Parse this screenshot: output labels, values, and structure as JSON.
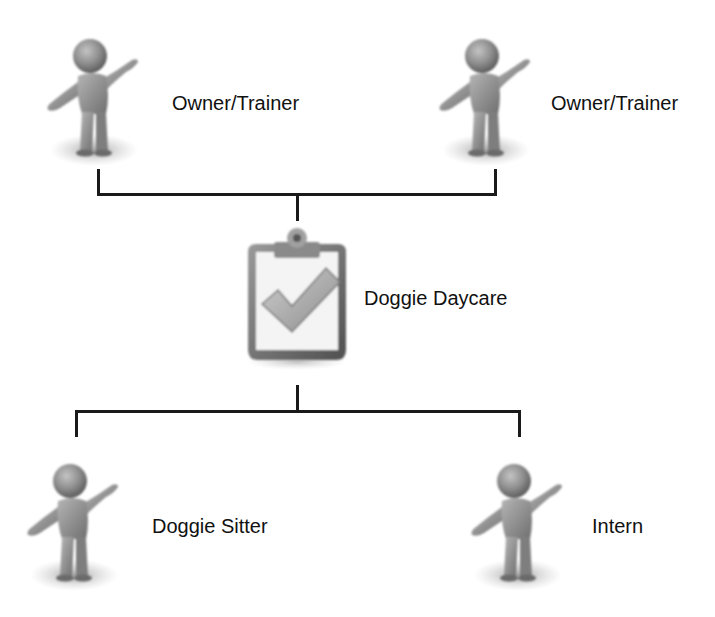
{
  "diagram": {
    "type": "org-chart",
    "top_nodes": [
      {
        "label": "Owner/Trainer",
        "icon": "person-figure-icon"
      },
      {
        "label": "Owner/Trainer",
        "icon": "person-figure-icon"
      }
    ],
    "center_node": {
      "label": "Doggie Daycare",
      "icon": "clipboard-check-icon"
    },
    "bottom_nodes": [
      {
        "label": "Doggie Sitter",
        "icon": "person-figure-icon"
      },
      {
        "label": "Intern",
        "icon": "person-figure-icon"
      }
    ],
    "colors": {
      "line": "#1a1a1a",
      "figure": "#8a8a8a",
      "clipboard": "#6e6e6e",
      "background": "#ffffff"
    }
  }
}
